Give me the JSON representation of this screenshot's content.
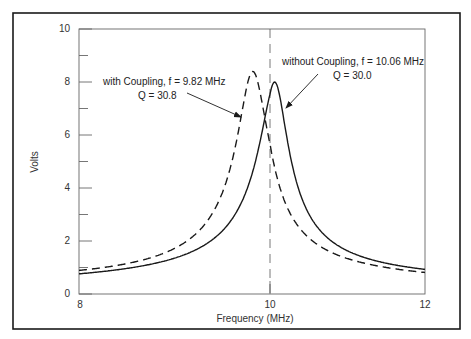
{
  "chart_data": {
    "type": "line",
    "title": "",
    "xlabel": "Frequency (MHz)",
    "ylabel": "Volts",
    "xlim": [
      8,
      12
    ],
    "ylim": [
      0,
      10
    ],
    "x_ticks": [
      "8",
      "10",
      "12"
    ],
    "y_ticks": [
      "0",
      "2",
      "4",
      "6",
      "8",
      "10"
    ],
    "y_minor_ticks": [
      1,
      3,
      5,
      7,
      9
    ],
    "grid": false,
    "reference_line": {
      "x": 10,
      "style": "dashed"
    },
    "series": [
      {
        "name": "with Coupling",
        "style": "dashed",
        "center_freq_mhz": 9.82,
        "q": 30.8,
        "peak_volts": 8.4,
        "x": [
          8.0,
          8.5,
          9.0,
          9.3,
          9.5,
          9.65,
          9.75,
          9.82,
          9.9,
          10.0,
          10.2,
          10.5,
          11.0,
          11.5,
          12.0
        ],
        "values": [
          0.7,
          0.95,
          1.5,
          2.3,
          3.6,
          5.6,
          7.6,
          8.4,
          7.8,
          5.8,
          3.2,
          1.9,
          1.2,
          0.95,
          0.75
        ]
      },
      {
        "name": "without Coupling",
        "style": "solid",
        "center_freq_mhz": 10.06,
        "q": 30.0,
        "peak_volts": 8.0,
        "x": [
          8.0,
          8.5,
          9.0,
          9.3,
          9.6,
          9.8,
          9.95,
          10.06,
          10.15,
          10.3,
          10.5,
          10.8,
          11.2,
          11.6,
          12.0
        ],
        "values": [
          0.6,
          0.8,
          1.15,
          1.6,
          2.6,
          4.2,
          6.6,
          8.0,
          7.4,
          5.1,
          3.2,
          2.0,
          1.35,
          1.05,
          0.85
        ]
      }
    ],
    "annotations": [
      {
        "line1": "with Coupling, f = 9.82 MHz",
        "line2": "Q = 30.8",
        "target_series": "with Coupling"
      },
      {
        "line1": "without Coupling, f = 10.06 MHz",
        "line2": "Q = 30.0",
        "target_series": "without Coupling"
      }
    ]
  },
  "labels": {
    "xlabel": "Frequency (MHz)",
    "ylabel": "Volts",
    "y0": "0",
    "y2": "2",
    "y4": "4",
    "y6": "6",
    "y8": "8",
    "y10": "10",
    "x8": "8",
    "x10": "10",
    "x12": "12",
    "ann1_line1": "with Coupling, f = 9.82 MHz",
    "ann1_line2": "Q = 30.8",
    "ann2_line1": "without Coupling, f = 10.06 MHz",
    "ann2_line2": "Q = 30.0"
  },
  "colors": {
    "line": "#1a1a1a",
    "frame": "#1a1a1a",
    "axis": "#555555",
    "background": "#ffffff"
  }
}
